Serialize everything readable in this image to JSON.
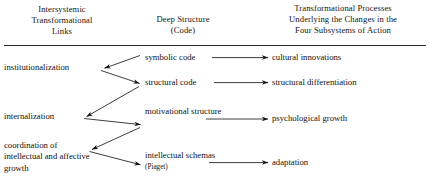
{
  "diagram": {
    "title_columns": {
      "left": "Intersystemic Transformational Links",
      "middle": "Deep Structure (Code)",
      "right": "Transformational Processes Underlying the Changes in the Four Subsystems of Action"
    },
    "headers": [
      {
        "id": "left",
        "line1": "Intersystemic",
        "line2": "Transformational",
        "line3": "Links"
      },
      {
        "id": "middle",
        "line1": "Deep Structure",
        "line2": "(Code)",
        "line3": ""
      },
      {
        "id": "right",
        "line1": "Transformational Processes",
        "line2": "Underlying the Changes in the",
        "line3": "Four Subsystems of Action"
      }
    ],
    "columns": {
      "links": [
        {
          "id": "institutionalization",
          "label": "institutionalization"
        },
        {
          "id": "internalization",
          "label": "internalization"
        },
        {
          "id": "coordination",
          "label": "coordination of intellectual and affective growth"
        }
      ],
      "deep_structure": [
        {
          "id": "symbolic-code",
          "label": "symbolic code",
          "note": ""
        },
        {
          "id": "structural-code",
          "label": "structural code",
          "note": ""
        },
        {
          "id": "motivational",
          "label": "motivational structure",
          "note": ""
        },
        {
          "id": "intellectual",
          "label": "intellectual schemas",
          "note": "(Piaget)"
        }
      ],
      "processes": [
        {
          "id": "cultural",
          "label": "cultural innovations"
        },
        {
          "id": "structural-dif",
          "label": "structural differentiation"
        },
        {
          "id": "psych-growth",
          "label": "psychological growth"
        },
        {
          "id": "adaptation",
          "label": "adaptation"
        }
      ]
    },
    "connections": [
      {
        "from": "symbolic-code",
        "to": "institutionalization",
        "kind": "diagonal-left"
      },
      {
        "from": "institutionalization",
        "to": "structural-code",
        "kind": "diagonal-right"
      },
      {
        "from": "structural-code",
        "to": "internalization",
        "kind": "diagonal-left"
      },
      {
        "from": "internalization",
        "to": "motivational",
        "kind": "diagonal-right"
      },
      {
        "from": "motivational",
        "to": "coordination",
        "kind": "diagonal-left"
      },
      {
        "from": "coordination",
        "to": "intellectual",
        "kind": "diagonal-right"
      },
      {
        "from": "symbolic-code",
        "to": "cultural",
        "kind": "horizontal"
      },
      {
        "from": "structural-code",
        "to": "structural-dif",
        "kind": "horizontal"
      },
      {
        "from": "motivational",
        "to": "psych-growth",
        "kind": "horizontal"
      },
      {
        "from": "intellectual",
        "to": "adaptation",
        "kind": "horizontal"
      }
    ],
    "colors": {
      "ink": "#121212",
      "rule": "#2a2a2a",
      "background": "#ffffff"
    }
  }
}
